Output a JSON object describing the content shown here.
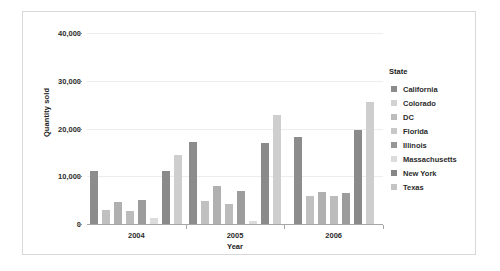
{
  "chart_data": {
    "type": "bar",
    "title": "",
    "subtitle": "",
    "xlabel": "Year",
    "ylabel": "Quantity sold",
    "categories": [
      "2004",
      "2005",
      "2006"
    ],
    "ylim": [
      0,
      40000
    ],
    "y_ticks": [
      0,
      10000,
      20000,
      30000,
      40000
    ],
    "y_tick_labels": [
      "0",
      "10,000",
      "20,000",
      "30,000",
      "40,000"
    ],
    "grid": true,
    "grid_axis": "y",
    "legend_title": "State",
    "legend_position": "right",
    "series": [
      {
        "name": "California",
        "color": "#8c8c8c",
        "values": [
          11200,
          17200,
          18200
        ]
      },
      {
        "name": "Colorado",
        "color": "#cfcfcf",
        "values": [
          null,
          null,
          null
        ]
      },
      {
        "name": "DC",
        "color": "#b4b4b4",
        "values": [
          3000,
          4900,
          5900
        ]
      },
      {
        "name": "Florida",
        "color": "#a8a8a8",
        "values": [
          4700,
          8000,
          6700
        ]
      },
      {
        "name": "Illinois",
        "color": "#8c8c8c",
        "values": [
          2800,
          4100,
          5800
        ]
      },
      {
        "name": "Massachusetts",
        "color": "#d9d9d9",
        "values": [
          5000,
          7000,
          6600
        ]
      },
      {
        "name": "New York",
        "color": "#808080",
        "values": [
          1300,
          700,
          19600
        ]
      },
      {
        "name": "Texas",
        "color": "#c4c4c4",
        "values": [
          11000,
          17000,
          25600
        ]
      }
    ],
    "groups": [
      {
        "category": "2004",
        "bars": [
          {
            "state": "California",
            "value": 11200,
            "color": "#8c8c8c"
          },
          {
            "state": "DC",
            "value": 3000,
            "color": "#c0c0c0"
          },
          {
            "state": "Florida",
            "value": 4700,
            "color": "#b0b0b0"
          },
          {
            "state": "Illinois",
            "value": 2800,
            "color": "#bcbcbc"
          },
          {
            "state": "Massachusetts",
            "value": 5000,
            "color": "#9c9c9c"
          },
          {
            "state": "New York",
            "value": 1300,
            "color": "#dcdcdc"
          },
          {
            "state": "Texas",
            "value": 11000,
            "color": "#8a8a8a"
          },
          {
            "state": "Texas-light",
            "value": 14500,
            "color": "#cecece"
          }
        ]
      },
      {
        "category": "2005",
        "bars": [
          {
            "state": "California",
            "value": 17200,
            "color": "#8c8c8c"
          },
          {
            "state": "DC",
            "value": 4900,
            "color": "#c0c0c0"
          },
          {
            "state": "Florida",
            "value": 8000,
            "color": "#b0b0b0"
          },
          {
            "state": "Illinois",
            "value": 4100,
            "color": "#bcbcbc"
          },
          {
            "state": "Massachusetts",
            "value": 7000,
            "color": "#9c9c9c"
          },
          {
            "state": "New York",
            "value": 700,
            "color": "#dcdcdc"
          },
          {
            "state": "Texas",
            "value": 17000,
            "color": "#8a8a8a"
          },
          {
            "state": "Texas-light",
            "value": 22800,
            "color": "#cecece"
          }
        ]
      },
      {
        "category": "2006",
        "bars": [
          {
            "state": "California",
            "value": 18200,
            "color": "#8c8c8c"
          },
          {
            "state": "DC",
            "value": 5900,
            "color": "#c0c0c0"
          },
          {
            "state": "Florida",
            "value": 6700,
            "color": "#b0b0b0"
          },
          {
            "state": "Illinois",
            "value": 5800,
            "color": "#bcbcbc"
          },
          {
            "state": "Massachusetts",
            "value": 6600,
            "color": "#9c9c9c"
          },
          {
            "state": "New York",
            "value": 19600,
            "color": "#8a8a8a"
          },
          {
            "state": "Texas",
            "value": 25600,
            "color": "#cecece"
          }
        ]
      }
    ]
  },
  "legend": {
    "title": "State",
    "items": [
      {
        "label": "California",
        "color": "#8c8c8c"
      },
      {
        "label": "Colorado",
        "color": "#d2d2d2"
      },
      {
        "label": "DC",
        "color": "#bcbcbc"
      },
      {
        "label": "Florida",
        "color": "#c8c8c8"
      },
      {
        "label": "Illinois",
        "color": "#969696"
      },
      {
        "label": "Massachusetts",
        "color": "#dcdcdc"
      },
      {
        "label": "New York",
        "color": "#868686"
      },
      {
        "label": "Texas",
        "color": "#c4c4c4"
      }
    ]
  },
  "axes": {
    "y_title": "Quantity sold",
    "x_title": "Year",
    "y_labels": [
      "40,000",
      "30,000",
      "20,000",
      "10,000",
      "0"
    ],
    "x_labels": [
      "2004",
      "2005",
      "2006"
    ]
  }
}
